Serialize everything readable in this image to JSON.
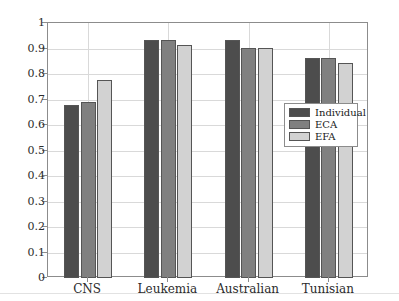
{
  "chart_data": {
    "type": "bar",
    "title": "",
    "xlabel": "",
    "ylabel": "",
    "ylim": [
      0,
      1
    ],
    "ytick_step": 0.1,
    "grid": true,
    "legend_position": "center-right",
    "categories": [
      "CNS",
      "Leukemia",
      "Australian",
      "Tunisian"
    ],
    "ytick_labels": [
      "0",
      "0.1",
      "0.2",
      "0.3",
      "0.4",
      "0.5",
      "0.6",
      "0.7",
      "0.8",
      "0.9",
      "1"
    ],
    "series": [
      {
        "name": "Individual",
        "color": "#4d4d4d",
        "values": [
          0.677,
          0.935,
          0.932,
          0.862
        ]
      },
      {
        "name": "ECA",
        "color": "#808080",
        "values": [
          0.692,
          0.935,
          0.9,
          0.862
        ]
      },
      {
        "name": "EFA",
        "color": "#d2d2d2",
        "values": [
          0.777,
          0.912,
          0.9,
          0.845
        ]
      }
    ]
  },
  "legend": {
    "items": [
      {
        "label": "Individual",
        "color": "#4d4d4d"
      },
      {
        "label": "ECA",
        "color": "#808080"
      },
      {
        "label": "EFA",
        "color": "#d2d2d2"
      }
    ]
  },
  "axes": {
    "y_axis_name": "y-axis",
    "x_axis_name": "x-axis",
    "border_color": "#8c8c8c",
    "grid_color": "#d9d9d9"
  }
}
